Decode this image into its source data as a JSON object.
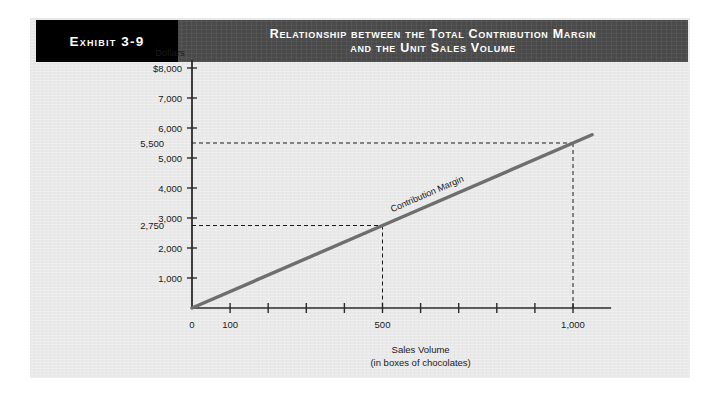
{
  "exhibit": {
    "tag": "Exhibit 3-9",
    "title_line1": "Relationship between the Total Contribution Margin",
    "title_line2": "and the Unit Sales Volume",
    "tag_bg": "#000000",
    "header_bg": "#4a4a4a",
    "panel_bg": "#e9e9e9"
  },
  "chart_data": {
    "type": "line",
    "title": "Relationship between the Total Contribution Margin and the Unit Sales Volume",
    "xlabel": "Sales Volume",
    "xlabel_sub": "(in boxes of chocolates)",
    "ylabel": "Dollars",
    "xlim": [
      0,
      1100
    ],
    "ylim": [
      0,
      8000
    ],
    "grid": false,
    "legend": "none",
    "line_color": "#6e6e6e",
    "axis_color": "#2b2b2b",
    "series": [
      {
        "name": "Contribution Margin",
        "x": [
          0,
          500,
          1000,
          1050
        ],
        "values": [
          0,
          2750,
          5500,
          5775
        ]
      }
    ],
    "x_ticks": [
      0,
      100,
      200,
      300,
      400,
      500,
      600,
      700,
      800,
      900,
      1000
    ],
    "x_tick_labels": [
      "0",
      "100",
      "",
      "",
      "",
      "500",
      "",
      "",
      "",
      "",
      "1,000"
    ],
    "y_ticks": [
      1000,
      2000,
      3000,
      4000,
      5000,
      6000,
      7000,
      8000
    ],
    "y_tick_labels": [
      "1,000",
      "2,000",
      "3,000",
      "4,000",
      "5,000",
      "6,000",
      "7,000",
      "$8,000"
    ],
    "annotations": [
      {
        "label": "5,500",
        "y": 5500,
        "type": "dashed-hline-to",
        "x": 1000
      },
      {
        "label": "2,750",
        "y": 2750,
        "type": "dashed-hline-to",
        "x": 500
      }
    ],
    "series_label": "Contribution Margin"
  }
}
